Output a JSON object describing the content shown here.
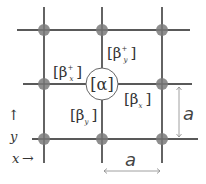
{
  "diagram": {
    "type": "square-lattice",
    "colors": {
      "line": "#222222",
      "atom": "#7a7a7a",
      "center_fill": "#ffffff",
      "center_stroke": "#666666",
      "dimension_arrow": "#888888"
    },
    "center_site": {
      "label": "[α]"
    },
    "bonds": {
      "y_plus": {
        "label": "[β",
        "sub": "y",
        "sup": "+",
        "close": "]"
      },
      "x_plus": {
        "label": "[β",
        "sub": "x",
        "sup": "+",
        "close": "]"
      },
      "x": {
        "label": "[β",
        "sub": "x",
        "close": "]"
      },
      "y": {
        "label": "[β",
        "sub": "y",
        "close": "]"
      }
    },
    "axes": {
      "y_label": "y",
      "y_arrow": "↑",
      "x_label": "x",
      "x_arrow": "→"
    },
    "dimensions": {
      "vertical_label": "a",
      "horizontal_label": "a"
    }
  }
}
